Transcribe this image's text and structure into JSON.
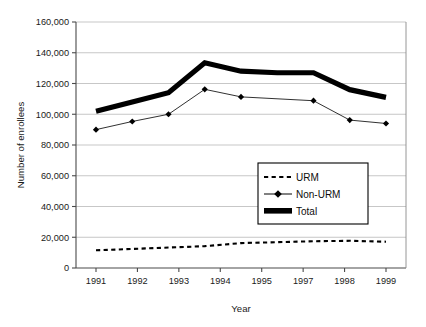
{
  "chart_data": {
    "type": "line",
    "title": "",
    "xlabel": "Year",
    "ylabel": "Number of enrollees",
    "x": [
      1991,
      1992,
      1993,
      1994,
      1995,
      1996,
      1997,
      1998,
      1999
    ],
    "xtick_labels": [
      "1991",
      "1992",
      "1993",
      "1994",
      "1995",
      "1997",
      "1998",
      "1999"
    ],
    "ytick_labels": [
      "0",
      "20,000",
      "40,000",
      "60,000",
      "80,000",
      "100,000",
      "120,000",
      "140,000",
      "160,000"
    ],
    "ytick_values": [
      0,
      20000,
      40000,
      60000,
      80000,
      100000,
      120000,
      140000,
      160000
    ],
    "ylim": [
      0,
      160000
    ],
    "grid": "horizontal",
    "legend_position": "center-right",
    "series": [
      {
        "name": "URM",
        "style": "dashed",
        "marker": "none",
        "values": [
          11500,
          12400,
          13300,
          14200,
          16200,
          16800,
          17400,
          17700,
          17100
        ]
      },
      {
        "name": "Non-URM",
        "style": "thin-solid",
        "marker": "diamond",
        "values": [
          90000,
          95300,
          100000,
          116200,
          111300,
          null,
          108800,
          96200,
          94000
        ]
      },
      {
        "name": "Total",
        "style": "thick-solid",
        "marker": "none",
        "values": [
          102000,
          108000,
          114000,
          133500,
          128000,
          127000,
          127000,
          116000,
          111000
        ]
      }
    ]
  },
  "legend": {
    "items": [
      {
        "label": "URM",
        "swatch": "dashed-line"
      },
      {
        "label": "Non-URM",
        "swatch": "line-with-diamond"
      },
      {
        "label": "Total",
        "swatch": "thick-bar"
      }
    ]
  }
}
